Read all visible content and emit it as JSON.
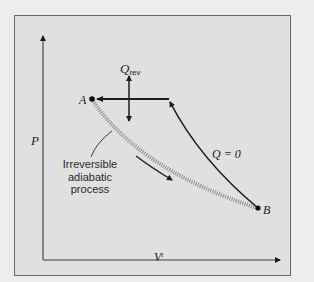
{
  "figure": {
    "axes": {
      "y_label": "P",
      "x_label": "V",
      "x_label_superscript": "t"
    },
    "points": {
      "a_label": "A",
      "b_label": "B"
    },
    "heat_label": {
      "symbol": "Q",
      "subscript": "rev"
    },
    "reversible_path_label": "Q = 0",
    "irreversible_caption": {
      "line1": "Irreversible",
      "line2": "adiabatic",
      "line3": "process"
    },
    "colors": {
      "background": "#ededed",
      "panel": "#e0e0e0",
      "line": "#1c1c1c",
      "hatched_path": "#8a8a8a"
    }
  }
}
